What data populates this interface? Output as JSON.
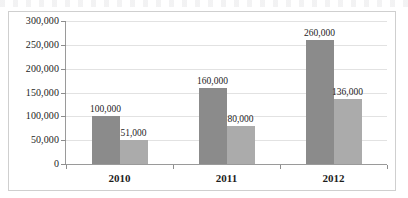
{
  "chart_data": {
    "type": "bar",
    "title": "",
    "subtitle": "",
    "xlabel": "",
    "ylabel": "",
    "categories": [
      "2010",
      "2011",
      "2012"
    ],
    "series": [
      {
        "name": "Series 1",
        "color": "#8b8b8b",
        "values": [
          100000,
          160000,
          260000
        ],
        "labels": [
          "100,000",
          "160,000",
          "260,000"
        ]
      },
      {
        "name": "Series 2",
        "color": "#ababab",
        "values": [
          51000,
          80000,
          136000
        ],
        "labels": [
          "51,000",
          "80,000",
          "136,000"
        ]
      }
    ],
    "ylim": [
      0,
      300000
    ],
    "ytick_values": [
      0,
      50000,
      100000,
      150000,
      200000,
      250000,
      300000
    ],
    "ytick_labels": [
      "0",
      "50,000",
      "100,000",
      "150,000",
      "200,000",
      "250,000",
      "300,000"
    ],
    "grid": true,
    "grid_axis": "y",
    "legend": false,
    "legend_position": "none",
    "data_labels": true,
    "frame_border_color": "#cfcfcf",
    "axis_color": "#9a9a9a",
    "gridline_color": "#e2e2e2",
    "background_color": "#ffffff"
  }
}
